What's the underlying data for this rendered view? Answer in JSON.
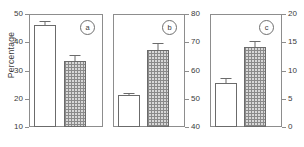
{
  "figure": {
    "ylabel": "Percentage",
    "background": "#ffffff",
    "axis_color": "#8d8d8d",
    "bar_edge_color": "#6b6b6b",
    "open_bar_color": "#ffffff",
    "hatched_bar_color": "#d8d8d8"
  },
  "panels": [
    {
      "id": "a",
      "badge": "a",
      "axis_side": "left",
      "ylim": [
        10,
        50
      ],
      "yticks": [
        10,
        20,
        30,
        40,
        50
      ],
      "yticklabels": [
        "10",
        "20",
        "30",
        "40",
        "50"
      ],
      "bars": [
        {
          "style": "open",
          "value": 46.2,
          "err": 1.2
        },
        {
          "style": "hatch",
          "value": 33.3,
          "err": 2.2
        }
      ]
    },
    {
      "id": "b",
      "badge": "b",
      "axis_side": "right",
      "ylim": [
        40,
        80
      ],
      "yticks": [
        40,
        50,
        60,
        70,
        80
      ],
      "yticklabels": [
        "40",
        "50",
        "60",
        "70",
        "80"
      ],
      "bars": [
        {
          "style": "open",
          "value": 51.3,
          "err": 0.8
        },
        {
          "style": "hatch",
          "value": 67.3,
          "err": 2.3
        }
      ]
    },
    {
      "id": "c",
      "badge": "c",
      "axis_side": "right",
      "ylim": [
        0,
        20
      ],
      "yticks": [
        0,
        5,
        10,
        15,
        20
      ],
      "yticklabels": [
        "0",
        "5",
        "10",
        "15",
        "20"
      ],
      "bars": [
        {
          "style": "open",
          "value": 7.8,
          "err": 0.8
        },
        {
          "style": "hatch",
          "value": 14.1,
          "err": 1.1
        }
      ]
    }
  ],
  "chart_data": {
    "type": "bar",
    "title": "",
    "xlabel": "",
    "ylabel": "Percentage",
    "grid": false,
    "legend": null,
    "categories": [
      "open",
      "hatched"
    ],
    "panels": [
      {
        "label": "a",
        "ylim": [
          10,
          50
        ],
        "yticks": [
          10,
          20,
          30,
          40,
          50
        ],
        "axis_side": "left",
        "values": [
          46.2,
          33.3
        ],
        "errors": [
          1.2,
          2.2
        ]
      },
      {
        "label": "b",
        "ylim": [
          40,
          80
        ],
        "yticks": [
          40,
          50,
          60,
          70,
          80
        ],
        "axis_side": "right",
        "values": [
          51.3,
          67.3
        ],
        "errors": [
          0.8,
          2.3
        ]
      },
      {
        "label": "c",
        "ylim": [
          0,
          20
        ],
        "yticks": [
          0,
          5,
          10,
          15,
          20
        ],
        "axis_side": "right",
        "values": [
          7.8,
          14.1
        ],
        "errors": [
          0.8,
          1.1
        ]
      }
    ]
  }
}
